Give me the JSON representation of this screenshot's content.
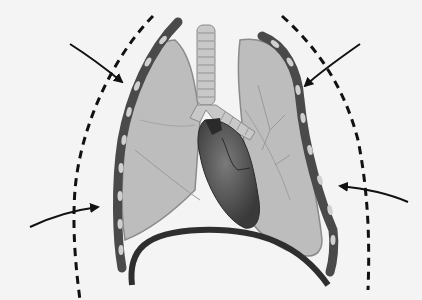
{
  "diagram": {
    "labels": [],
    "elements": {
      "left_arrow_upper": {
        "direction": "inward",
        "target": "right chest wall (viewer's left)"
      },
      "left_arrow_lower": {
        "direction": "inward",
        "target": "right chest wall (viewer's left)"
      },
      "right_arrow_upper": {
        "direction": "inward",
        "target": "left chest wall (viewer's right)"
      },
      "right_arrow_lower": {
        "direction": "inward",
        "target": "left chest wall (viewer's right)"
      },
      "dashed_outline_left": {
        "style": "dashed",
        "meaning": "expanded chest boundary"
      },
      "dashed_outline_right": {
        "style": "dashed",
        "meaning": "expanded chest boundary"
      }
    },
    "colors": {
      "background": "#f4f4f4",
      "lung_fill": "#bdbdbd",
      "lung_stroke": "#8a8a8a",
      "chest_wall": "#4a4a4a",
      "rib_segment": "#d0d0d0",
      "heart_dark": "#3a3a3a",
      "heart_mid": "#6a6a6a",
      "trachea": "#c8c8c8",
      "diaphragm": "#2e2e2e",
      "arrow": "#111111",
      "dashes": "#111111"
    }
  }
}
